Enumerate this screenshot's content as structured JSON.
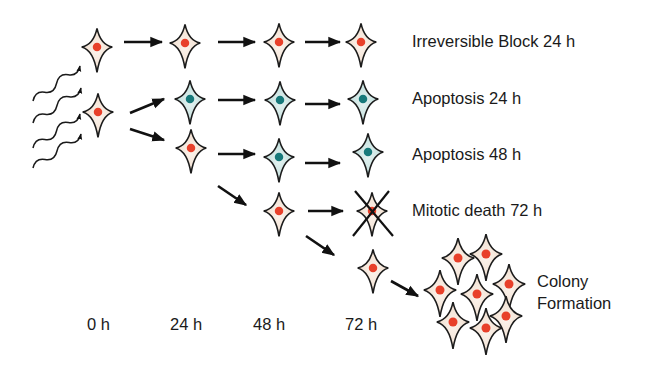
{
  "colors": {
    "normal_cytoplasm": "#f6e8dc",
    "normal_nucleus": "#e8402a",
    "apoptotic_cytoplasm": "#cfe6e4",
    "apoptotic_nucleus": "#17797a",
    "outline": "#1c1c1c",
    "arrow": "#111111"
  },
  "outcomes": [
    {
      "label": "Irreversible Block 24 h"
    },
    {
      "label": "Apoptosis 24 h"
    },
    {
      "label": "Apoptosis 48 h"
    },
    {
      "label": "Mitotic death 72 h"
    },
    {
      "label_line1": "Colony",
      "label_line2": "Formation"
    }
  ],
  "timepoints": [
    "0 h",
    "24 h",
    "48 h",
    "72 h"
  ],
  "radiation": {
    "icon": "wavy-radiation-arrows",
    "count": 4
  },
  "cells": [
    {
      "id": "r0-t0",
      "x": 97,
      "y": 47,
      "type": "normal"
    },
    {
      "id": "r1-t0",
      "x": 98,
      "y": 112,
      "type": "normal"
    },
    {
      "id": "r1-t24",
      "x": 185,
      "y": 43,
      "type": "normal"
    },
    {
      "id": "r1-t48",
      "x": 279,
      "y": 42,
      "type": "normal"
    },
    {
      "id": "r1-t72",
      "x": 361,
      "y": 42,
      "type": "normal"
    },
    {
      "id": "r2-t24",
      "x": 190,
      "y": 99,
      "type": "apoptotic"
    },
    {
      "id": "r2-t48",
      "x": 280,
      "y": 100,
      "type": "apoptotic"
    },
    {
      "id": "r2-t72",
      "x": 363,
      "y": 99,
      "type": "apoptotic"
    },
    {
      "id": "r3-t24",
      "x": 191,
      "y": 148,
      "type": "normal"
    },
    {
      "id": "r3-t48",
      "x": 279,
      "y": 157,
      "type": "apoptotic"
    },
    {
      "id": "r3-t72",
      "x": 368,
      "y": 152,
      "type": "apoptotic"
    },
    {
      "id": "r4-t48",
      "x": 279,
      "y": 211,
      "type": "normal"
    },
    {
      "id": "r4-t72",
      "x": 372,
      "y": 211,
      "type": "normal",
      "crossed": true
    },
    {
      "id": "r5-t72",
      "x": 373,
      "y": 268,
      "type": "normal"
    }
  ],
  "colony": [
    {
      "x": 458,
      "y": 258
    },
    {
      "x": 486,
      "y": 254
    },
    {
      "x": 440,
      "y": 290
    },
    {
      "x": 477,
      "y": 294
    },
    {
      "x": 509,
      "y": 284
    },
    {
      "x": 453,
      "y": 322
    },
    {
      "x": 486,
      "y": 328
    },
    {
      "x": 506,
      "y": 316
    }
  ],
  "arrows": [
    {
      "x1": 124,
      "y1": 42,
      "x2": 162,
      "y2": 42
    },
    {
      "x1": 218,
      "y1": 42,
      "x2": 255,
      "y2": 42
    },
    {
      "x1": 305,
      "y1": 42,
      "x2": 340,
      "y2": 42
    },
    {
      "x1": 130,
      "y1": 113,
      "x2": 164,
      "y2": 99
    },
    {
      "x1": 218,
      "y1": 100,
      "x2": 255,
      "y2": 100
    },
    {
      "x1": 305,
      "y1": 104,
      "x2": 340,
      "y2": 104
    },
    {
      "x1": 130,
      "y1": 129,
      "x2": 164,
      "y2": 140
    },
    {
      "x1": 218,
      "y1": 154,
      "x2": 255,
      "y2": 154
    },
    {
      "x1": 305,
      "y1": 163,
      "x2": 340,
      "y2": 163
    },
    {
      "x1": 218,
      "y1": 186,
      "x2": 246,
      "y2": 205
    },
    {
      "x1": 308,
      "y1": 211,
      "x2": 343,
      "y2": 211
    },
    {
      "x1": 306,
      "y1": 236,
      "x2": 334,
      "y2": 255
    },
    {
      "x1": 391,
      "y1": 281,
      "x2": 418,
      "y2": 296
    }
  ]
}
